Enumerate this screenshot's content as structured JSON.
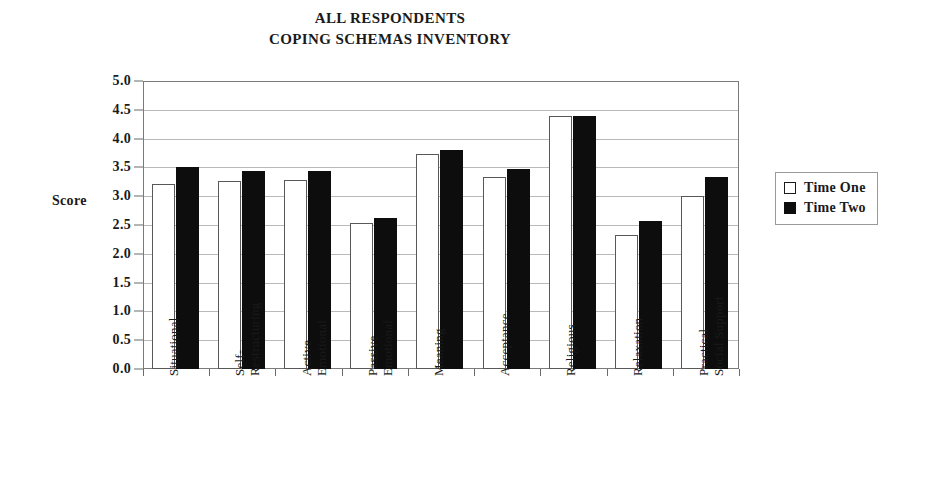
{
  "chart_data": {
    "type": "bar",
    "title": "ALL RESPONDENTS COPING SCHEMAS INVENTORY",
    "title_lines": [
      "ALL RESPONDENTS",
      "COPING SCHEMAS INVENTORY"
    ],
    "xlabel": "",
    "ylabel": "Score",
    "ylim": [
      0.0,
      5.0
    ],
    "ytick_step": 0.5,
    "ytick_labels": [
      "5.0",
      "4.5",
      "4.0",
      "3.5",
      "3.0",
      "2.5",
      "2.0",
      "1.5",
      "1.0",
      "0.5",
      "0.0"
    ],
    "ytick_values": [
      5.0,
      4.5,
      4.0,
      3.5,
      3.0,
      2.5,
      2.0,
      1.5,
      1.0,
      0.5,
      0.0
    ],
    "grid": true,
    "grid_axis": "y",
    "legend_position": "right",
    "categories": [
      "Situational",
      "Self- Restructuring",
      "Active Emotional",
      "Passive Emotional",
      "Meaning",
      "Acceptance",
      "Religious",
      "Relaxation",
      "Practical Social Support"
    ],
    "category_lines": [
      [
        "Situational"
      ],
      [
        "Self-",
        "Restructuring"
      ],
      [
        "Active",
        "Emotional"
      ],
      [
        "Passive",
        "Emotional"
      ],
      [
        "Meaning"
      ],
      [
        "Acceptance"
      ],
      [
        "Religious"
      ],
      [
        "Relaxation"
      ],
      [
        "Practical",
        "Social Support"
      ]
    ],
    "series": [
      {
        "name": "Time One",
        "color": "#ffffff",
        "edge_color": "#585858",
        "values": [
          3.22,
          3.28,
          3.29,
          2.55,
          3.75,
          3.35,
          4.4,
          2.33,
          3.02
        ]
      },
      {
        "name": "Time Two",
        "color": "#0d0d0d",
        "edge_color": "#0d0d0d",
        "values": [
          3.52,
          3.45,
          3.45,
          2.63,
          3.81,
          3.48,
          4.4,
          2.57,
          3.34
        ]
      }
    ]
  },
  "legend": {
    "items": [
      {
        "label": "Time One",
        "swatch": "open-square"
      },
      {
        "label": "Time Two",
        "swatch": "filled-square"
      }
    ]
  }
}
